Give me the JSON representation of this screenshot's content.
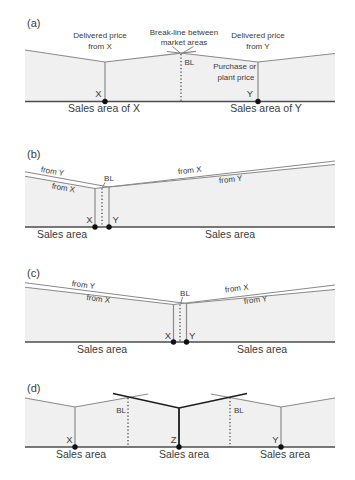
{
  "figure_type": "economic-geography-market-area-diagram",
  "colors": {
    "background": "#ffffff",
    "area_fill": "#f0f0f0",
    "price_line": "#8a8a8a",
    "emphasis_line": "#1c1c1c",
    "axis_line": "#4d4d4d",
    "text": "#3b3b3b"
  },
  "a": {
    "tag": "(a)",
    "dpx1": "Delivered price",
    "dpx2": "from X",
    "bln1": "Break-line between",
    "bln2": "market areas",
    "dpy1": "Delivered price",
    "dpy2": "from Y",
    "pp1": "Purchase or",
    "pp2": "plant price",
    "bl": "BL",
    "x": "X",
    "y": "Y",
    "sales_x": "Sales area of X",
    "sales_y": "Sales area of Y"
  },
  "b": {
    "tag": "(b)",
    "left_upper": "from Y",
    "left_lower": "from X",
    "right_upper": "from X",
    "right_lower": "from Y",
    "bl": "BL",
    "x": "X",
    "y": "Y",
    "sales_left": "Sales area",
    "sales_right": "Sales area"
  },
  "c": {
    "tag": "(c)",
    "left_upper": "from Y",
    "left_lower": "from X",
    "right_upper": "from X",
    "right_lower": "from Y",
    "bl": "BL",
    "x": "X",
    "y": "Y",
    "sales_left": "Sales area",
    "sales_right": "Sales area"
  },
  "d": {
    "tag": "(d)",
    "bl_left": "BL",
    "bl_right": "BL",
    "x": "X",
    "z": "Z",
    "y": "Y",
    "sales_left": "Sales area",
    "sales_center": "Sales area",
    "sales_right": "Sales area"
  }
}
